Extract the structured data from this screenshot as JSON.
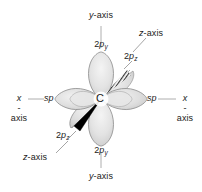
{
  "figure": {
    "atom": {
      "symbol": "C",
      "name": "carbon-atom-label"
    },
    "colors": {
      "background": "#ffffff",
      "text": "#1b1b1b",
      "axis_line": "#9a9a9a",
      "leader_line": "#8e8e8e",
      "lobe_fill_light": "#e9e9e9",
      "lobe_fill_mid": "#dcdcdc",
      "lobe_fill_dark": "#cfcfcf",
      "lobe_stroke": "#8c8c8c",
      "wedge_solid": "#000000",
      "wedge_hash": "#3a3a3a"
    },
    "labels": {
      "y_axis_top": {
        "text": "y-axis",
        "italic_part": "y",
        "rest": "-axis"
      },
      "y_axis_bottom": {
        "text": "y-axis",
        "italic_part": "y",
        "rest": "-axis"
      },
      "z_axis_top_right": {
        "text": "z-axis",
        "italic_part": "z",
        "rest": "-axis"
      },
      "z_axis_bottom_left": {
        "text": "z-axis",
        "italic_part": "z",
        "rest": "-axis"
      },
      "x_axis_left": {
        "line1_italic": "x",
        "line1_rest": "-",
        "line2": "axis"
      },
      "x_axis_right": {
        "line1_italic": "x",
        "line1_rest": "-",
        "line2": "axis"
      },
      "orbital_2py_top": {
        "prefix": "2",
        "italic": "p",
        "subscript": "y"
      },
      "orbital_2py_bottom": {
        "prefix": "2",
        "italic": "p",
        "subscript": "y"
      },
      "orbital_2pz_top_right": {
        "prefix": "2",
        "italic": "p",
        "subscript": "z"
      },
      "orbital_2pz_bottom_left": {
        "prefix": "2",
        "italic": "p",
        "subscript": "z"
      },
      "sp_left": {
        "italic": "sp"
      },
      "sp_right": {
        "italic": "sp"
      }
    }
  }
}
